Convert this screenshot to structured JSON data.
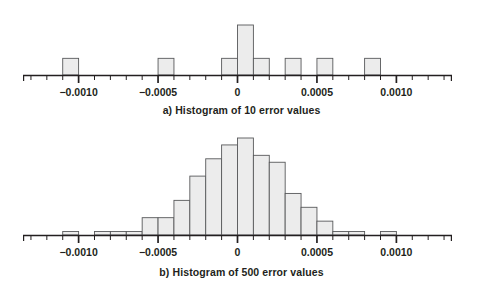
{
  "figure": {
    "background_color": "#ffffff",
    "bar_fill_color": "#ececec",
    "bar_stroke_color": "#58595b",
    "axis_color": "#231f20",
    "text_color": "#231f20"
  },
  "panels": [
    {
      "id": "a",
      "caption": "a) Histogram of 10 error values",
      "axis": {
        "tick_labels": [
          "−0.0010",
          "−0.0005",
          "0",
          "0.0005",
          "0.0010"
        ],
        "tick_values": [
          -0.001,
          -0.0005,
          0,
          0.0005,
          0.001
        ],
        "minor_tick_step": 0.0001,
        "xmin": -0.00135,
        "xmax": 0.00135
      }
    },
    {
      "id": "b",
      "caption": "b) Histogram of 500 error values",
      "axis": {
        "tick_labels": [
          "−0.0010",
          "−0.0005",
          "0",
          "0.0005",
          "0.0010"
        ],
        "tick_values": [
          -0.001,
          -0.0005,
          0,
          0.0005,
          0.001
        ],
        "minor_tick_step": 0.0001,
        "xmin": -0.00135,
        "xmax": 0.00135
      }
    }
  ],
  "chart_data": [
    {
      "type": "bar",
      "id": "histogram-10",
      "title": "a) Histogram of 10 error values",
      "xlabel": "",
      "ylabel": "",
      "bin_width": 0.0001,
      "xlim": [
        -0.00135,
        0.00135
      ],
      "ylim": [
        0,
        3
      ],
      "grid": false,
      "legend": false,
      "bin_left_edges": [
        -0.0011,
        -0.0005,
        -0.0001,
        0.0,
        0.0001,
        0.0003,
        0.0005,
        0.0008
      ],
      "bin_right_edges": [
        -0.001,
        -0.0004,
        0.0,
        0.0001,
        0.0002,
        0.0004,
        0.0006,
        0.0009
      ],
      "values": [
        1,
        1,
        1,
        3,
        1,
        1,
        1,
        1
      ],
      "tick_labels": [
        "−0.0010",
        "−0.0005",
        "0",
        "0.0005",
        "0.0010"
      ]
    },
    {
      "type": "bar",
      "id": "histogram-500",
      "title": "b) Histogram of 500 error values",
      "xlabel": "",
      "ylabel": "",
      "bin_width": 0.0001,
      "xlim": [
        -0.00135,
        0.00135
      ],
      "ylim": [
        0,
        14
      ],
      "grid": false,
      "legend": false,
      "bin_left_edges": [
        -0.0011,
        -0.0009,
        -0.0008,
        -0.0007,
        -0.0006,
        -0.0005,
        -0.0004,
        -0.0003,
        -0.0002,
        -0.0001,
        0.0,
        0.0001,
        0.0002,
        0.0003,
        0.0004,
        0.0005,
        0.0006,
        0.0007,
        0.0009
      ],
      "bin_right_edges": [
        -0.001,
        -0.0008,
        -0.0007,
        -0.0006,
        -0.0005,
        -0.0004,
        -0.0003,
        -0.0002,
        -0.0001,
        0.0,
        0.0001,
        0.0002,
        0.0003,
        0.0004,
        0.0005,
        0.0006,
        0.0007,
        0.0008,
        0.001
      ],
      "values": [
        0.5,
        0.5,
        0.5,
        0.5,
        2.5,
        2.5,
        5,
        8.5,
        11,
        13,
        14,
        11.5,
        10.5,
        6,
        4,
        2,
        0.5,
        0.5,
        0.5
      ],
      "tick_labels": [
        "−0.0010",
        "−0.0005",
        "0",
        "0.0005",
        "0.0010"
      ]
    }
  ]
}
